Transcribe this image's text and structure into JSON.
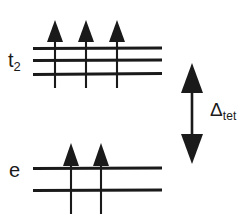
{
  "diagram": {
    "kind": "crystal-field-splitting-diagram",
    "geometry": "tetrahedral",
    "background_color": "#ffffff",
    "ink_color": "#1a1a1a",
    "labels": {
      "upper_set_symbol": "t",
      "upper_set_subscript": "2",
      "lower_set_symbol": "e",
      "lower_set_subscript": "",
      "splitting_symbol": "Δ",
      "splitting_subscript": "tet"
    },
    "levels": [
      {
        "name": "t2",
        "degeneracy": 3,
        "electrons": 3,
        "line_y": [
          48,
          60,
          74
        ],
        "line_x_start": 33,
        "line_x_end": 162,
        "electron_x": [
          54,
          85,
          116
        ],
        "electron_spin": [
          "up",
          "up",
          "up"
        ]
      },
      {
        "name": "e",
        "degeneracy": 2,
        "electrons": 2,
        "line_y": [
          168,
          190
        ],
        "line_x_start": 33,
        "line_x_end": 162,
        "electron_x": [
          70,
          100
        ],
        "electron_spin": [
          "up",
          "up"
        ]
      }
    ],
    "splitting_arrow": {
      "x": 192,
      "y_top": 65,
      "y_bottom": 162,
      "heads": "both"
    },
    "total_electrons": 5
  }
}
